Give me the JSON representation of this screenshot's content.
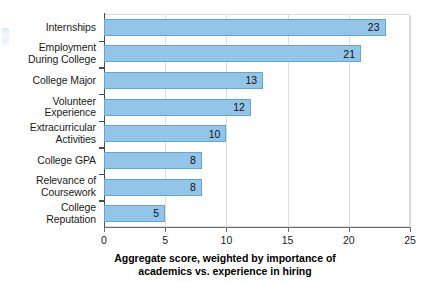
{
  "chart_data": {
    "type": "bar",
    "orientation": "horizontal",
    "title": "",
    "subtitle": "",
    "xlabel": "Aggregate score, weighted by importance of academics vs. experience in hiring",
    "xlabel_lines": [
      "Aggregate score, weighted by importance of",
      "academics vs. experience in hiring"
    ],
    "ylabel": "",
    "categories": [
      "Internships",
      "Employment During College",
      "College Major",
      "Volunteer Experience",
      "Extracurricular Activities",
      "College GPA",
      "Relevance of Coursework",
      "College Reputation"
    ],
    "category_lines": [
      [
        "Internships"
      ],
      [
        "Employment",
        "During College"
      ],
      [
        "College Major"
      ],
      [
        "Volunteer",
        "Experience"
      ],
      [
        "Extracurricular",
        "Activities"
      ],
      [
        "College GPA"
      ],
      [
        "Relevance of",
        "Coursework"
      ],
      [
        "College",
        "Reputation"
      ]
    ],
    "values": [
      23,
      21,
      13,
      12,
      10,
      8,
      8,
      5
    ],
    "data_labels": [
      "23",
      "21",
      "13",
      "12",
      "10",
      "8",
      "8",
      "5"
    ],
    "xlim": [
      0,
      25
    ],
    "xticks": [
      0,
      5,
      10,
      15,
      20,
      25
    ],
    "xtick_labels": [
      "0",
      "5",
      "10",
      "15",
      "20",
      "25"
    ],
    "grid": true,
    "grid_axis": "x",
    "legend": false,
    "legend_position": "none",
    "colors": {
      "bar_fill": "#92c5e8",
      "bar_border": "#5fa8d3",
      "gridline": "#dcdcdc",
      "axis": "#4c4c4c",
      "text": "#1b1b1b",
      "background": "#ffffff"
    }
  }
}
